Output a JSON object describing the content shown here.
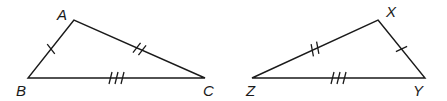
{
  "diagram": {
    "type": "congruent-triangles",
    "triangles": [
      {
        "name": "triangle-ABC",
        "vertices": {
          "A": {
            "label": "A",
            "x": 74,
            "y": 20,
            "lx": 57,
            "ly": 20
          },
          "B": {
            "label": "B",
            "x": 28,
            "y": 78,
            "lx": 16,
            "ly": 96
          },
          "C": {
            "label": "C",
            "x": 205,
            "y": 78,
            "lx": 203,
            "ly": 96
          }
        },
        "sides": [
          {
            "from": "A",
            "to": "B",
            "ticks": 1
          },
          {
            "from": "A",
            "to": "C",
            "ticks": 2
          },
          {
            "from": "B",
            "to": "C",
            "ticks": 3
          }
        ]
      },
      {
        "name": "triangle-XYZ",
        "vertices": {
          "X": {
            "label": "X",
            "x": 378,
            "y": 20,
            "lx": 386,
            "ly": 17
          },
          "Y": {
            "label": "Y",
            "x": 425,
            "y": 78,
            "lx": 413,
            "ly": 96
          },
          "Z": {
            "label": "Z",
            "x": 252,
            "y": 78,
            "lx": 246,
            "ly": 96
          }
        },
        "sides": [
          {
            "from": "X",
            "to": "Y",
            "ticks": 1
          },
          {
            "from": "X",
            "to": "Z",
            "ticks": 2
          },
          {
            "from": "Z",
            "to": "Y",
            "ticks": 3
          }
        ]
      }
    ],
    "colors": {
      "stroke": "#1a1a1a",
      "background": "#ffffff"
    }
  }
}
